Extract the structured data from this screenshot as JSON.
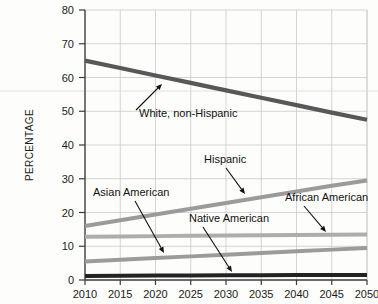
{
  "chart_data": {
    "type": "line",
    "title": "",
    "xlabel": "",
    "ylabel": "PERCENTAGE",
    "xlim": [
      2010,
      2050
    ],
    "ylim": [
      0,
      80
    ],
    "grid": true,
    "legend_position": "none-inline-annotations",
    "x": [
      2010,
      2015,
      2020,
      2025,
      2030,
      2035,
      2040,
      2045,
      2050
    ],
    "x_tick_labels": [
      "2010",
      "2015",
      "2020",
      "2025",
      "2030",
      "2035",
      "2040",
      "2045",
      "2050"
    ],
    "y_tick_labels": [
      "0",
      "10",
      "20",
      "30",
      "40",
      "50",
      "60",
      "70",
      "80"
    ],
    "y_ticks": [
      0,
      10,
      20,
      30,
      40,
      50,
      60,
      70,
      80
    ],
    "series": [
      {
        "name": "White, non-Hispanic",
        "color": "#585858",
        "width": 4.2,
        "values": [
          65.0,
          62.8,
          60.6,
          58.4,
          56.2,
          54.0,
          51.8,
          49.6,
          47.5
        ]
      },
      {
        "name": "Hispanic",
        "color": "#9b9b9b",
        "width": 4.0,
        "values": [
          16.0,
          17.7,
          19.4,
          21.1,
          22.8,
          24.5,
          26.2,
          27.9,
          29.5
        ]
      },
      {
        "name": "African American",
        "color": "#adadad",
        "width": 4.0,
        "values": [
          12.8,
          12.9,
          13.0,
          13.1,
          13.2,
          13.25,
          13.35,
          13.4,
          13.5
        ]
      },
      {
        "name": "Asian American",
        "color": "#9b9b9b",
        "width": 4.0,
        "values": [
          5.5,
          6.0,
          6.5,
          7.0,
          7.5,
          8.0,
          8.5,
          9.0,
          9.5
        ]
      },
      {
        "name": "Native American",
        "color": "#232323",
        "width": 4.0,
        "values": [
          1.2,
          1.25,
          1.3,
          1.35,
          1.4,
          1.4,
          1.45,
          1.5,
          1.5
        ]
      }
    ],
    "annotations": [
      {
        "label": "White, non-Hispanic",
        "text_x": 139,
        "text_y": 117,
        "arrow_from_x": 136,
        "arrow_from_y": 110,
        "arrow_to_x": 162,
        "arrow_to_y": 84
      },
      {
        "label": "Hispanic",
        "text_x": 204,
        "text_y": 163,
        "arrow_from_x": 226,
        "arrow_from_y": 168,
        "arrow_to_x": 245,
        "arrow_to_y": 194
      },
      {
        "label": "Asian American",
        "text_x": 93,
        "text_y": 196,
        "arrow_from_x": 135,
        "arrow_from_y": 201,
        "arrow_to_x": 164,
        "arrow_to_y": 253
      },
      {
        "label": "Native American",
        "text_x": 189,
        "text_y": 222,
        "arrow_from_x": 203,
        "arrow_from_y": 227,
        "arrow_to_x": 232,
        "arrow_to_y": 272
      },
      {
        "label": "African American",
        "text_x": 285,
        "text_y": 201,
        "arrow_from_x": 304,
        "arrow_from_y": 206,
        "arrow_to_x": 326,
        "arrow_to_y": 232
      }
    ]
  }
}
